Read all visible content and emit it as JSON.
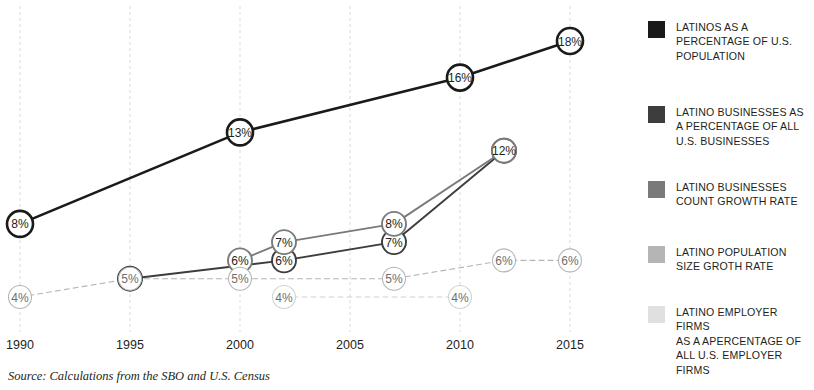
{
  "chart_data": {
    "type": "line",
    "title": "",
    "subtitle": "",
    "xlabel": "",
    "ylabel": "",
    "grid": true,
    "legend_position": "right",
    "x_ticks": [
      "1990",
      "1995",
      "2000",
      "2005",
      "2010",
      "2015"
    ],
    "xlim": [
      1990,
      2016
    ],
    "ylim": [
      3,
      19
    ],
    "value_suffix": "%",
    "series": [
      {
        "name": "Latinos as a percentage of U.S. population",
        "color": "#1a1a1a",
        "weight": "heavy",
        "x": [
          1990,
          2000,
          2010,
          2015
        ],
        "values": [
          8,
          13,
          16,
          18
        ],
        "labels": [
          "8%",
          "13%",
          "16%",
          "18%"
        ]
      },
      {
        "name": "Latino businesses as a percentage of all U.S. businesses",
        "color": "#3d3d3d",
        "weight": "medium",
        "x": [
          1995,
          2002,
          2007,
          2012
        ],
        "values": [
          5,
          6,
          7,
          12
        ],
        "labels": [
          "5%",
          "6%",
          "7%",
          "12%"
        ]
      },
      {
        "name": "Latino businesses count growth rate",
        "color": "#7a7a7a",
        "weight": "medium",
        "x": [
          2000,
          2002,
          2007,
          2012
        ],
        "values": [
          6,
          7,
          8,
          12
        ],
        "labels": [
          "6%",
          "7%",
          "8%",
          "12%"
        ]
      },
      {
        "name": "Latino population size groth rate",
        "color": "#b5b5b5",
        "weight": "light",
        "x": [
          1990,
          1995,
          2000,
          2007,
          2012,
          2015
        ],
        "values": [
          4,
          5,
          5,
          5,
          6,
          6
        ],
        "labels": [
          "4%",
          "5%",
          "5%",
          "5%",
          "6%",
          "6%"
        ]
      },
      {
        "name": "Latino employer firms as a apercentage of all U.S. employer firms",
        "color": "#d2d2d2",
        "weight": "light",
        "x": [
          2002,
          2010
        ],
        "values": [
          4,
          4
        ],
        "labels": [
          "4%",
          "4%"
        ]
      }
    ]
  },
  "axis": {
    "ticks": [
      {
        "label": "1990"
      },
      {
        "label": "1995"
      },
      {
        "label": "2000"
      },
      {
        "label": "2005"
      },
      {
        "label": "2010"
      },
      {
        "label": "2015"
      }
    ]
  },
  "legend": {
    "items": [
      {
        "swatch": "#1a1a1a",
        "lines": [
          "LATINOS AS A",
          "PERCENTAGE OF U.S.",
          "POPULATION"
        ]
      },
      {
        "swatch": "#3d3d3d",
        "lines": [
          "LATINO BUSINESSES AS",
          "A PERCENTAGE OF ALL",
          "U.S. BUSINESSES"
        ]
      },
      {
        "swatch": "#7a7a7a",
        "lines": [
          "LATINO BUSINESSES",
          "COUNT GROWTH RATE"
        ]
      },
      {
        "swatch": "#b5b5b5",
        "lines": [
          "LATINO POPULATION",
          "SIZE GROTH RATE"
        ]
      },
      {
        "swatch": "#e0e0e0",
        "lines": [
          "LATINO EMPLOYER FIRMS",
          "AS A APERCENTAGE OF",
          "ALL U.S. EMPLOYER FIRMS"
        ]
      }
    ]
  },
  "source": {
    "text": "Source: Calculations from the SBO and U.S. Census"
  }
}
